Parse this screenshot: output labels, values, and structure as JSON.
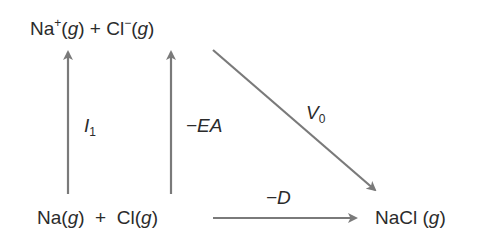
{
  "diagram": {
    "nodes": {
      "ions": {
        "species1": "Na",
        "charge1": "+",
        "state1": "(g)",
        "plus": "+",
        "species2": "Cl",
        "charge2": "−",
        "state2": "(g)"
      },
      "atoms": {
        "species1": "Na",
        "state1": "(g)",
        "plus": "+",
        "species2": "Cl",
        "state2": "(g)"
      },
      "product": {
        "species": "NaCl",
        "state": "(g)"
      }
    },
    "edges": [
      {
        "id": "ionization",
        "from": "Na(g)",
        "to": "Na+(g)",
        "label_main": "I",
        "label_sub": "1"
      },
      {
        "id": "electron-affinity",
        "from": "Cl(g)",
        "to": "Cl−(g)",
        "label_main": "−EA"
      },
      {
        "id": "lattice",
        "from": "Na+(g) + Cl−(g)",
        "to": "NaCl(g)",
        "label_main": "V",
        "label_sub": "0"
      },
      {
        "id": "dissociation",
        "from": "Na(g) + Cl(g)",
        "to": "NaCl(g)",
        "label_main": "−D"
      }
    ],
    "colors": {
      "arrow": "#7a7a7a",
      "text": "#2b2b2b"
    }
  }
}
